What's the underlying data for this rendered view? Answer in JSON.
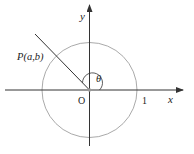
{
  "diagram": {
    "type": "unit-circle",
    "labels": {
      "x_axis": "x",
      "y_axis": "y",
      "origin": "O",
      "unit": "1",
      "point": "P(a,b)",
      "angle": "θ"
    },
    "colors": {
      "axes": "#333333",
      "circle": "#aaaaaa",
      "ray": "#333333"
    }
  }
}
